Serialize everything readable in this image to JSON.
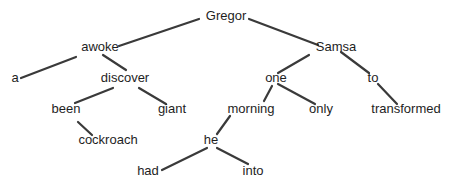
{
  "diagram": {
    "type": "dependency-tree",
    "colors": {
      "edge": "#3a3a3a",
      "text": "#1e1e1e",
      "background": "#ffffff"
    },
    "nodes": [
      {
        "id": "gregor",
        "label": "Gregor",
        "x": 226,
        "y": 17
      },
      {
        "id": "awoke",
        "label": "awoke",
        "x": 100,
        "y": 48
      },
      {
        "id": "samsa",
        "label": "Samsa",
        "x": 336,
        "y": 48
      },
      {
        "id": "a",
        "label": "a",
        "x": 15,
        "y": 79
      },
      {
        "id": "discover",
        "label": "discover",
        "x": 125,
        "y": 79
      },
      {
        "id": "one",
        "label": "one",
        "x": 276,
        "y": 79
      },
      {
        "id": "to",
        "label": "to",
        "x": 373,
        "y": 79
      },
      {
        "id": "been",
        "label": "been",
        "x": 66,
        "y": 110
      },
      {
        "id": "giant",
        "label": "giant",
        "x": 172,
        "y": 110
      },
      {
        "id": "morning",
        "label": "morning",
        "x": 251,
        "y": 110
      },
      {
        "id": "only",
        "label": "only",
        "x": 321,
        "y": 110
      },
      {
        "id": "transformed",
        "label": "transformed",
        "x": 406,
        "y": 110
      },
      {
        "id": "cockroach",
        "label": "cockroach",
        "x": 108,
        "y": 141
      },
      {
        "id": "he",
        "label": "he",
        "x": 211,
        "y": 141
      },
      {
        "id": "had",
        "label": "had",
        "x": 148,
        "y": 172
      },
      {
        "id": "into",
        "label": "into",
        "x": 253,
        "y": 172
      }
    ],
    "edges": [
      {
        "from": "gregor",
        "to": "awoke",
        "x1": 199,
        "y1": 19,
        "x2": 119,
        "y2": 46
      },
      {
        "from": "gregor",
        "to": "samsa",
        "x1": 249,
        "y1": 19,
        "x2": 318,
        "y2": 45
      },
      {
        "from": "awoke",
        "to": "a",
        "x1": 76,
        "y1": 57,
        "x2": 21,
        "y2": 78
      },
      {
        "from": "awoke",
        "to": "discover",
        "x1": 103,
        "y1": 55,
        "x2": 126,
        "y2": 70
      },
      {
        "from": "samsa",
        "to": "one",
        "x1": 309,
        "y1": 55,
        "x2": 278,
        "y2": 73
      },
      {
        "from": "samsa",
        "to": "to",
        "x1": 341,
        "y1": 52,
        "x2": 369,
        "y2": 73
      },
      {
        "from": "discover",
        "to": "been",
        "x1": 113,
        "y1": 88,
        "x2": 75,
        "y2": 103
      },
      {
        "from": "discover",
        "to": "giant",
        "x1": 139,
        "y1": 88,
        "x2": 166,
        "y2": 104
      },
      {
        "from": "one",
        "to": "morning",
        "x1": 272,
        "y1": 86,
        "x2": 264,
        "y2": 101
      },
      {
        "from": "one",
        "to": "only",
        "x1": 278,
        "y1": 84,
        "x2": 315,
        "y2": 104
      },
      {
        "from": "to",
        "to": "transformed",
        "x1": 378,
        "y1": 84,
        "x2": 397,
        "y2": 104
      },
      {
        "from": "been",
        "to": "cockroach",
        "x1": 78,
        "y1": 122,
        "x2": 92,
        "y2": 135
      },
      {
        "from": "morning",
        "to": "he",
        "x1": 230,
        "y1": 116,
        "x2": 217,
        "y2": 134
      },
      {
        "from": "he",
        "to": "had",
        "x1": 207,
        "y1": 148,
        "x2": 162,
        "y2": 170
      },
      {
        "from": "he",
        "to": "into",
        "x1": 217,
        "y1": 148,
        "x2": 248,
        "y2": 164
      }
    ]
  }
}
